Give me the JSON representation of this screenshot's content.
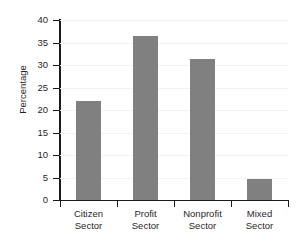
{
  "chart_data": {
    "type": "bar",
    "title": "",
    "xlabel": "",
    "ylabel": "Percentage",
    "categories": [
      "Citizen Sector",
      "Profit Sector",
      "Nonprofit Sector",
      "Mixed Sector"
    ],
    "category_lines": [
      [
        "Citizen",
        "Sector"
      ],
      [
        "Profit",
        "Sector"
      ],
      [
        "Nonprofit",
        "Sector"
      ],
      [
        "Mixed",
        "Sector"
      ]
    ],
    "values": [
      22.1,
      36.4,
      31.4,
      4.6
    ],
    "ylim": [
      0,
      40
    ],
    "ytick_labels": [
      "0",
      "5",
      "10",
      "15",
      "20",
      "25",
      "30",
      "35",
      "40"
    ],
    "ytick_values": [
      0,
      5,
      10,
      15,
      20,
      25,
      30,
      35,
      40
    ],
    "grid": true,
    "legend": "none",
    "bar_color": "#808080",
    "axis_color": "#1a1a1a",
    "gridline_color": "#f2f2f2",
    "background": "#ffffff"
  }
}
